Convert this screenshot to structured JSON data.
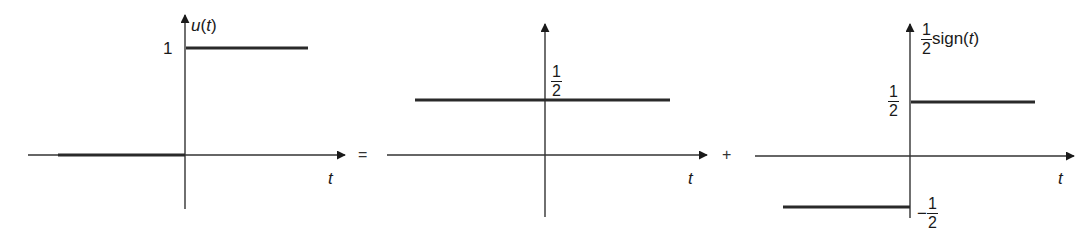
{
  "figure": {
    "operators": {
      "equals": "=",
      "plus": "+"
    },
    "panels": [
      {
        "id": "unit-step",
        "ylabel_func": "u",
        "ylabel_arg": "t",
        "xlabel": "t",
        "ticks": {
          "high": "1"
        },
        "segments": [
          {
            "from": "-inf",
            "to": 0,
            "value": 0
          },
          {
            "from": 0,
            "to": "inf",
            "value": 1
          }
        ]
      },
      {
        "id": "constant-half",
        "xlabel": "t",
        "ticks": {
          "high_num": "1",
          "high_den": "2"
        },
        "segments": [
          {
            "from": "-inf",
            "to": "inf",
            "value": 0.5
          }
        ]
      },
      {
        "id": "half-sign",
        "ylabel_num": "1",
        "ylabel_den": "2",
        "ylabel_func": "sign",
        "ylabel_arg": "t",
        "xlabel": "t",
        "ticks": {
          "high_num": "1",
          "high_den": "2",
          "low_sign": "−",
          "low_num": "1",
          "low_den": "2"
        },
        "segments": [
          {
            "from": "-inf",
            "to": 0,
            "value": -0.5
          },
          {
            "from": 0,
            "to": "inf",
            "value": 0.5
          }
        ]
      }
    ]
  }
}
